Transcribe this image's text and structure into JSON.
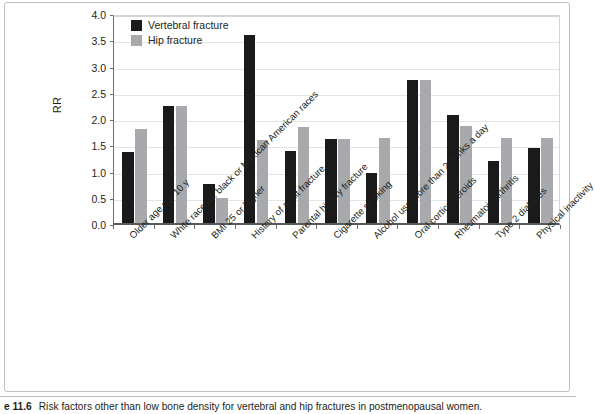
{
  "figure": {
    "caption_number": "e 11.6",
    "caption_text": "Risk factors other than low bone density for vertebral and hip fractures in postmenopausal women."
  },
  "legend": {
    "position": "top-left-inside",
    "entries": [
      {
        "label": "Vertebral fracture",
        "color": "#1a1a1a"
      },
      {
        "label": "Hip fracture",
        "color": "#a7a9ac"
      }
    ]
  },
  "axis": {
    "y_title": "RR",
    "y_ticks": [
      "0.0",
      "0.5",
      "1.0",
      "1.5",
      "2.0",
      "2.5",
      "3.0",
      "3.5",
      "4.0"
    ]
  },
  "chart_data": {
    "type": "bar",
    "title": "",
    "subtitle": "",
    "xlabel": "",
    "ylabel": "RR",
    "ylim": [
      0,
      4.0
    ],
    "ytick_step": 0.5,
    "grid": true,
    "legend_position": "upper left",
    "categories": [
      "Older age per 10 y",
      "White race vs. black or Mexican American races",
      "BMI 25 or higher",
      "History of adult fracture",
      "Parental history fracture",
      "Cigarette smoking",
      "Alcohol use more than 2 drinks a day",
      "Oral corticosteroids",
      "Rheumatoid arthritis",
      "Type 2 diabetes",
      "Physical inactivity"
    ],
    "series": [
      {
        "name": "Vertebral fracture",
        "color": "#1a1a1a",
        "values": [
          1.35,
          2.22,
          0.74,
          3.58,
          1.38,
          1.6,
          0.95,
          2.72,
          2.05,
          1.18,
          1.42
        ]
      },
      {
        "name": "Hip fracture",
        "color": "#a7a9ac",
        "values": [
          1.8,
          2.22,
          0.48,
          1.58,
          1.82,
          1.6,
          1.61,
          2.72,
          1.84,
          1.62,
          1.62
        ]
      }
    ]
  }
}
